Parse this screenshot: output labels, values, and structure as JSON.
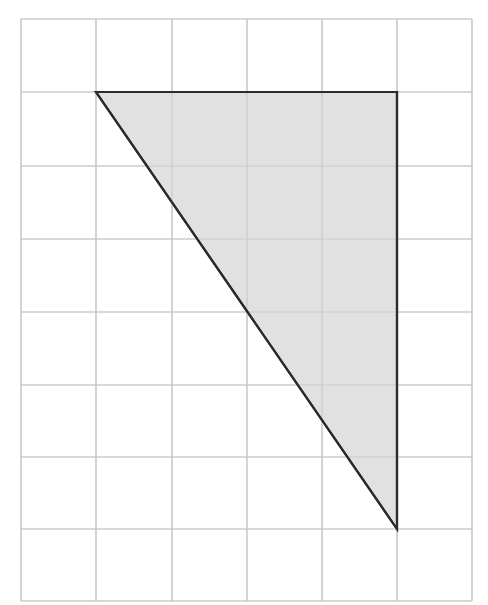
{
  "diagram": {
    "type": "grid-with-shape",
    "grid": {
      "columns": 6,
      "rows": 8,
      "x_lines": [
        21,
        96,
        172,
        247,
        322,
        397,
        472
      ],
      "y_lines": [
        19,
        92,
        166,
        239,
        312,
        385,
        457,
        529,
        601
      ],
      "line_color": "#c4c4c4"
    },
    "shape": {
      "kind": "right-triangle",
      "grid_vertices": [
        [
          1,
          1
        ],
        [
          5,
          1
        ],
        [
          5,
          7
        ]
      ],
      "pixel_vertices": [
        [
          96,
          92
        ],
        [
          397,
          92
        ],
        [
          397,
          529
        ]
      ],
      "legs_in_units": {
        "horizontal": 4,
        "vertical": 6
      },
      "fill_color": "#dcdcdc",
      "stroke_color": "#2b2b2b"
    }
  }
}
